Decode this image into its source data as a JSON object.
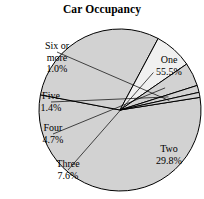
{
  "chart_data": {
    "type": "pie",
    "title": "Car Occupancy",
    "xlabel": "",
    "ylabel": "",
    "legend_position": "none",
    "grid": false,
    "units": "percent",
    "start_angle_deg": -9,
    "direction": "clockwise",
    "categories": [
      "One",
      "Two",
      "Three",
      "Four",
      "Five",
      "Six or more"
    ],
    "values": [
      55.5,
      29.8,
      7.6,
      4.7,
      1.4,
      1.0
    ],
    "value_labels": [
      "55.5%",
      "29.8%",
      "7.6%",
      "4.7%",
      "1.4%",
      "1.0%"
    ],
    "slices": [
      {
        "name": "One",
        "value": 55.5,
        "value_label": "55.5%",
        "color": "#d2d2d2",
        "label_placement": "inside",
        "label_x": 139,
        "label_y": 54
      },
      {
        "name": "Two",
        "value": 29.8,
        "value_label": "29.8%",
        "color": "#d2d2d2",
        "label_placement": "inside",
        "label_x": 139,
        "label_y": 143
      },
      {
        "name": "Three",
        "value": 7.6,
        "value_label": "7.6%",
        "color": "#f0f0f0",
        "label_placement": "outside",
        "label_x": 38,
        "label_y": 158
      },
      {
        "name": "Four",
        "value": 4.7,
        "value_label": "4.7%",
        "color": "#d2d2d2",
        "label_placement": "outside",
        "label_x": 23,
        "label_y": 122
      },
      {
        "name": "Five",
        "value": 1.4,
        "value_label": "1.4%",
        "color": "#d2d2d2",
        "label_placement": "outside",
        "label_x": 21,
        "label_y": 90
      },
      {
        "name": "Six or more",
        "value": 1.0,
        "value_label": "1.0%",
        "color": "#d2d2d2",
        "label_placement": "outside",
        "label_x": 27,
        "label_y": 40,
        "name_line_1": "Six or",
        "name_line_2": "more"
      }
    ],
    "geometry": {
      "center_x": 120,
      "center_y": 110,
      "radius": 81
    },
    "style": {
      "fill_default": "#d2d2d2",
      "fill_highlight": "#f0f0f0",
      "stroke": "#000000",
      "background": "#ffffff",
      "text_color": "#000000"
    }
  }
}
